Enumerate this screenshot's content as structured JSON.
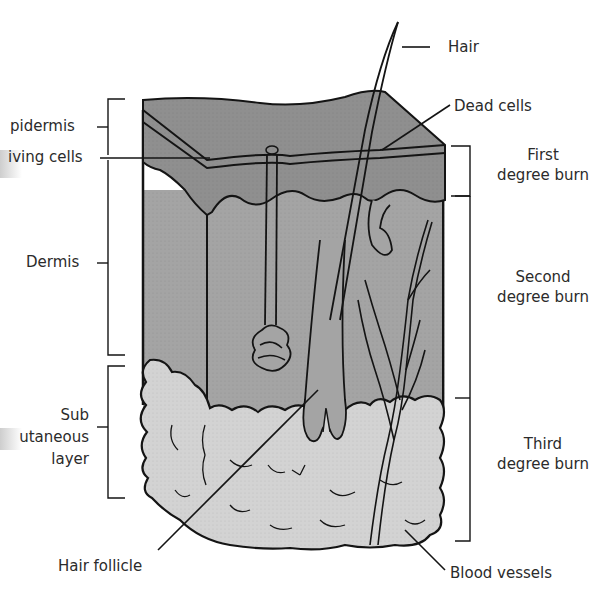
{
  "diagram": {
    "colors": {
      "epidermis": "#8f8f8f",
      "dermis": "#a3a3a3",
      "subcutaneous": "#d2d2d2",
      "outline": "#141414",
      "text": "#2b2b2b",
      "background": "#ffffff"
    },
    "left_labels": {
      "epidermis": "pidermis",
      "living_cells": "iving cells",
      "dermis": "Dermis",
      "subcutaneous_line1": "Sub",
      "subcutaneous_line2": "utaneous",
      "subcutaneous_line3": "layer"
    },
    "right_labels": {
      "hair": "Hair",
      "dead_cells": "Dead cells",
      "first_burn_line1": "First",
      "first_burn_line2": "degree burn",
      "second_burn_line1": "Second",
      "second_burn_line2": "degree burn",
      "third_burn_line1": "Third",
      "third_burn_line2": "degree burn",
      "blood_vessels": "Blood vessels"
    },
    "bottom_labels": {
      "hair_follicle": "Hair follicle"
    }
  }
}
